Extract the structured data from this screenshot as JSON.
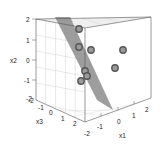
{
  "chart_data": {
    "type": "scatter3d",
    "title": "",
    "axes": {
      "x1": {
        "label": "x1",
        "ticks": [
          "-2",
          "-1",
          "0",
          "1",
          "2"
        ],
        "range": [
          -2,
          2
        ]
      },
      "x2": {
        "label": "x2",
        "ticks": [
          "-2",
          "-1",
          "0",
          "1",
          "2"
        ],
        "range": [
          -2,
          2
        ]
      },
      "x3": {
        "label": "x3",
        "ticks": [
          "-2",
          "-1",
          "0",
          "1",
          "2"
        ],
        "range": [
          -2,
          2
        ]
      }
    },
    "plane": {
      "description": "grey separating plane",
      "color": "#8c8c8c"
    },
    "points_screen": [
      {
        "x": 79,
        "y": 29
      },
      {
        "x": 79,
        "y": 47
      },
      {
        "x": 91,
        "y": 50
      },
      {
        "x": 123,
        "y": 50
      },
      {
        "x": 115,
        "y": 68
      },
      {
        "x": 85,
        "y": 71
      },
      {
        "x": 87,
        "y": 76
      },
      {
        "x": 81,
        "y": 81
      }
    ],
    "point_color": "#555555",
    "grid": true
  },
  "labels": {
    "x1": "x1",
    "x2": "x2",
    "x3": "x3",
    "x2_ticks": [
      "2",
      "1",
      "0",
      "-1",
      "-2"
    ],
    "x3_ticks": [
      "-2",
      "-1",
      "0",
      "1",
      "2"
    ],
    "x1_ticks": [
      "-2",
      "-1",
      "0",
      "1",
      "2"
    ]
  }
}
